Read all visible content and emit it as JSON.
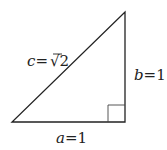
{
  "diagram": {
    "labels": {
      "hypotenuse_var": "c",
      "hypotenuse_eq": "=",
      "hypotenuse_root": "√",
      "hypotenuse_val": "2",
      "leg_b_var": "b",
      "leg_b_val": "=1",
      "leg_a_var": "a",
      "leg_a_val": "=1"
    },
    "stroke_color": "#222222",
    "right_angle_marker": true
  }
}
